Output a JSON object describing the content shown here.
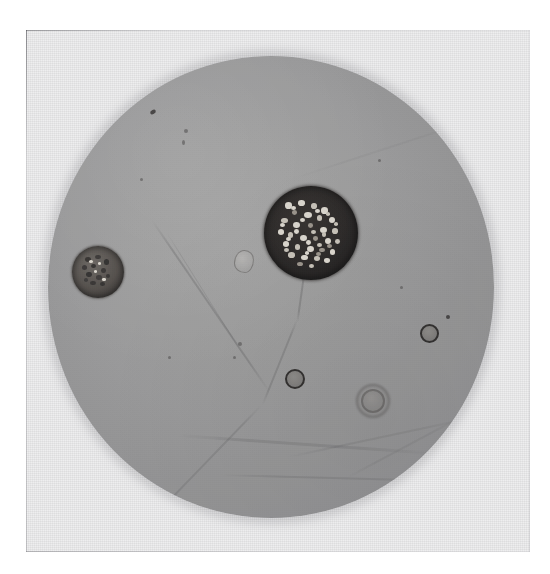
{
  "image": {
    "kind": "micrograph",
    "caption": "Photomicrograph showing a circular microscope field of view with two granular spore-like cells and several small ring-shaped bodies",
    "medium": "black-and-white photographic print on textured paper",
    "plate_background_color": "#ececed",
    "field_background_color": "#a1a1a1",
    "page_background_color": "#ffffff"
  },
  "plate": {
    "label": "photographic-print",
    "left": 26,
    "top": 30,
    "width": 504,
    "height": 522
  },
  "field_of_view": {
    "label": "microscope-field",
    "shape": "circle",
    "center_x": 271,
    "center_y": 287,
    "radius_x": 223,
    "radius_y": 231,
    "tone": "uniform mid-grey with soft vignette"
  },
  "objects": [
    {
      "id": "large-spore",
      "name": "large-granular-spore",
      "cx": 311,
      "cy": 233,
      "r": 47,
      "appearance": "very dark opaque body densely filled with bright granules",
      "tone": "near-black"
    },
    {
      "id": "small-spore",
      "name": "small-granular-spore",
      "cx": 98,
      "cy": 272,
      "r": 26,
      "appearance": "mid-grey body with coarse dark granules and darker rim",
      "tone": "mid-grey"
    },
    {
      "id": "ring-right",
      "name": "small-ring-body-right",
      "cx": 428,
      "cy": 302,
      "r": 8,
      "appearance": "thin dark circular outline with pale centre",
      "tone": "outline-dark"
    },
    {
      "id": "ring-centre",
      "name": "small-ring-body-centre",
      "cx": 294,
      "cy": 348,
      "r": 9,
      "appearance": "thin dark circular outline with grey centre",
      "tone": "outline-dark"
    },
    {
      "id": "ring-faint",
      "name": "faint-ring-body-lower-right",
      "cx": 372,
      "cy": 370,
      "r": 11,
      "appearance": "diffuse out-of-focus ring with dark halo",
      "tone": "faint"
    },
    {
      "id": "bubble-centre",
      "name": "air-bubble-artifact",
      "cx": 243,
      "cy": 259,
      "r": 9,
      "appearance": "irregular pale teardrop-shaped bubble in the mountant",
      "tone": "pale"
    }
  ],
  "artifacts": {
    "scratches": [
      {
        "name": "diagonal-scratch-upper-left",
        "x1": 213,
        "y1": 134,
        "x2": 96,
        "y2": 305
      },
      {
        "name": "vertical-crack-centre",
        "x1": 307,
        "y1": 257,
        "x2": 256,
        "y2": 398
      },
      {
        "name": "diagonal-scratch-lower-left",
        "x1": 262,
        "y1": 392,
        "x2": 160,
        "y2": 494
      },
      {
        "name": "horizontal-streak-lower",
        "x1": 180,
        "y1": 430,
        "x2": 430,
        "y2": 448
      },
      {
        "name": "horizontal-streak-lower-2",
        "x1": 220,
        "y1": 468,
        "x2": 420,
        "y2": 470
      }
    ],
    "specks": [
      {
        "name": "dust-speck-upper-left-1",
        "cx": 152,
        "cy": 112,
        "r": 3
      },
      {
        "name": "dust-speck-upper-left-2",
        "cx": 185,
        "cy": 130,
        "r": 2
      },
      {
        "name": "dust-speck-upper-left-3",
        "cx": 183,
        "cy": 141,
        "r": 2
      },
      {
        "name": "dust-speck-right",
        "cx": 447,
        "cy": 316,
        "r": 2
      },
      {
        "name": "dust-speck-mid",
        "cx": 238,
        "cy": 342,
        "r": 2
      },
      {
        "name": "dust-speck-lower",
        "cx": 233,
        "cy": 356,
        "r": 2
      },
      {
        "name": "dust-speck-corner",
        "cx": 30,
        "cy": 552,
        "r": 2
      }
    ]
  }
}
